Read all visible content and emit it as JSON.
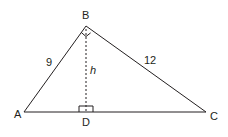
{
  "diagram": {
    "stroke_color": "#231f20",
    "background": "#ffffff",
    "vertices": {
      "A": {
        "label": "A",
        "x": 24,
        "y": 112
      },
      "B": {
        "label": "B",
        "x": 86,
        "y": 26
      },
      "C": {
        "label": "C",
        "x": 206,
        "y": 112
      },
      "D": {
        "label": "D",
        "x": 86,
        "y": 112
      }
    },
    "sides": {
      "AB": {
        "label": "9"
      },
      "BC": {
        "label": "12"
      }
    },
    "altitude": {
      "label": "h",
      "from": "B",
      "to": "D",
      "style": "dashed"
    },
    "right_angles": [
      "B",
      "D"
    ]
  }
}
